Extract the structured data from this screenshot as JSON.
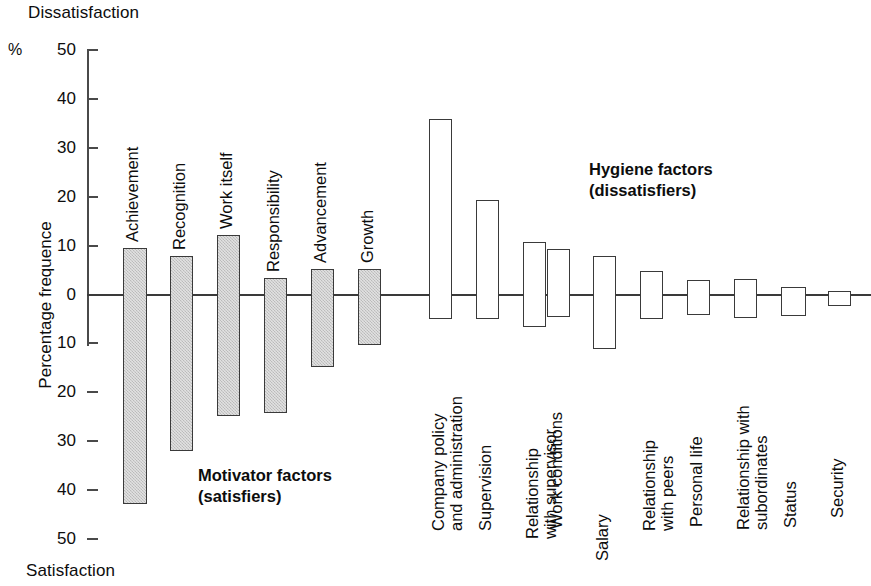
{
  "labels": {
    "top_axis_label": "Dissatisfaction",
    "bottom_axis_label": "Satisfaction",
    "percent_symbol": "%",
    "y_axis_title": "Percentage frequence"
  },
  "legends": {
    "motivator_line1": "Motivator factors",
    "motivator_line2": "(satisfiers)",
    "hygiene_line1": "Hygiene factors",
    "hygiene_line2": "(dissatisfiers)"
  },
  "colors": {
    "motivator_fill": "#c9c9c9",
    "hygiene_fill": "#ffffff",
    "bar_stroke": "#3a3a3a",
    "axis": "#4a4a4a",
    "text": "#0d0d0d"
  },
  "axis": {
    "ticks": [
      "50",
      "40",
      "30",
      "20",
      "10",
      "0",
      "10",
      "20",
      "30",
      "40",
      "50"
    ],
    "tick_values": [
      50,
      40,
      30,
      20,
      10,
      0,
      -10,
      -20,
      -30,
      -40,
      -50
    ],
    "range_top": 50,
    "range_bottom": -50
  },
  "chart_data": {
    "type": "bar",
    "title": "",
    "subtitle": "",
    "xlabel": "",
    "ylabel": "Percentage frequence",
    "ylim": [
      -50,
      50
    ],
    "grid": false,
    "legend_position": "inside",
    "axis_top_annotation": "Dissatisfaction",
    "axis_bottom_annotation": "Satisfaction",
    "note": "Herzberg two-factor theory: values above 0 indicate frequency as a dissatisfier, values below 0 indicate frequency as a satisfier.",
    "groups": [
      {
        "name": "Motivator factors (satisfiers)",
        "fill": "#c9c9c9",
        "items": [
          {
            "label": "Achievement",
            "label_line2": "",
            "top": 9.6,
            "bottom": -42.8
          },
          {
            "label": "Recognition",
            "label_line2": "",
            "top": 7.8,
            "bottom": -32.0
          },
          {
            "label": "Work itself",
            "label_line2": "",
            "top": 12.1,
            "bottom": -24.8
          },
          {
            "label": "Responsibility",
            "label_line2": "",
            "top": 3.3,
            "bottom": -24.3
          },
          {
            "label": "Advancement",
            "label_line2": "",
            "top": 5.3,
            "bottom": -14.8
          },
          {
            "label": "Growth",
            "label_line2": "",
            "top": 5.3,
            "bottom": -10.3
          }
        ]
      },
      {
        "name": "Hygiene factors (dissatisfiers)",
        "fill": "#ffffff",
        "items": [
          {
            "label": "Company policy",
            "label_line2": "and administration",
            "top": 35.8,
            "bottom": -5.1
          },
          {
            "label": "Supervision",
            "label_line2": "",
            "top": 19.4,
            "bottom": -5.1
          },
          {
            "label": "Relationship",
            "label_line2": "with supervisor",
            "top": 10.7,
            "bottom": -6.7
          },
          {
            "label": "Work conditions",
            "label_line2": "",
            "top": 9.3,
            "bottom": -4.6
          },
          {
            "label": "Salary",
            "label_line2": "",
            "top": 7.8,
            "bottom": -11.1
          },
          {
            "label": "Relationship",
            "label_line2": "with peers",
            "top": 4.8,
            "bottom": -5.0
          },
          {
            "label": "Personal life",
            "label_line2": "",
            "top": 2.9,
            "bottom": -4.1
          },
          {
            "label": "Relationship with",
            "label_line2": "subordinates",
            "top": 3.1,
            "bottom": -4.8
          },
          {
            "label": "Status",
            "label_line2": "",
            "top": 1.6,
            "bottom": -4.3
          },
          {
            "label": "Security",
            "label_line2": "",
            "top": 0.7,
            "bottom": -2.4
          }
        ]
      }
    ]
  },
  "layout": {
    "bar_x": [
      122.5,
      169.5,
      216.5,
      264.0,
      311.0,
      357.5,
      429.0,
      476.0,
      523.0,
      546.5,
      592.5,
      639.5,
      686.5,
      733.5,
      780.5,
      828.0
    ],
    "bar_w": [
      24,
      23,
      23,
      23,
      23,
      23,
      23,
      23,
      23,
      23,
      23,
      23,
      23,
      23,
      25,
      23
    ]
  }
}
